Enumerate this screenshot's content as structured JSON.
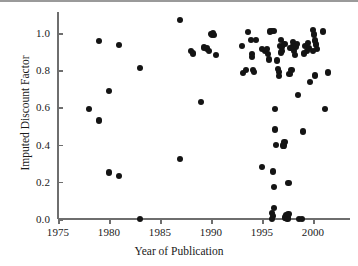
{
  "chart_data": {
    "type": "scatter",
    "title": "",
    "xlabel": "Year of Publication",
    "ylabel": "Imputed Discount Factor",
    "xlim": [
      1975,
      2003.6
    ],
    "ylim": [
      0.0,
      1.12
    ],
    "grid": false,
    "legend": null,
    "xticks": [
      1975,
      1980,
      1985,
      1990,
      1995,
      2000
    ],
    "xtick_labels": [
      "1975",
      "1980",
      "1985",
      "1990",
      "1995",
      "2000"
    ],
    "yticks": [
      0.0,
      0.2,
      0.4,
      0.6,
      0.8,
      1.0
    ],
    "ytick_labels": [
      "0.0",
      "0.2",
      "0.4",
      "0.6",
      "0.8",
      "1.0"
    ],
    "marker": "filled-circle",
    "marker_color": "#141414",
    "marker_size_px": 6.2,
    "n_points": 97,
    "points": [
      [
        1978.0,
        0.59
      ],
      [
        1979.0,
        0.955
      ],
      [
        1979.0,
        0.53
      ],
      [
        1980.0,
        0.69
      ],
      [
        1980.0,
        0.25
      ],
      [
        1981.0,
        0.935
      ],
      [
        1981.0,
        0.23
      ],
      [
        1983.0,
        0.812
      ],
      [
        1983.0,
        0.0
      ],
      [
        1987.0,
        1.07
      ],
      [
        1987.0,
        0.323
      ],
      [
        1988.0,
        0.902
      ],
      [
        1988.2,
        0.89
      ],
      [
        1989.0,
        0.628
      ],
      [
        1989.3,
        0.922
      ],
      [
        1989.6,
        0.917
      ],
      [
        1989.8,
        0.905
      ],
      [
        1990.0,
        0.995
      ],
      [
        1990.2,
        1.0
      ],
      [
        1990.1,
        0.992
      ],
      [
        1990.5,
        0.88
      ],
      [
        1993.0,
        0.93
      ],
      [
        1993.1,
        0.787
      ],
      [
        1993.6,
        1.005
      ],
      [
        1993.9,
        0.962
      ],
      [
        1994.0,
        0.885
      ],
      [
        1994.0,
        0.87
      ],
      [
        1994.1,
        0.8
      ],
      [
        1994.2,
        0.79
      ],
      [
        1995.0,
        0.278
      ],
      [
        1995.3,
        0.905
      ],
      [
        1995.5,
        0.915
      ],
      [
        1995.6,
        0.886
      ],
      [
        1995.7,
        0.858
      ],
      [
        1995.8,
        1.008
      ],
      [
        1996.0,
        1.012
      ],
      [
        1996.2,
        1.01
      ],
      [
        1996.0,
        0.033
      ],
      [
        1996.1,
        0.018
      ],
      [
        1996.0,
        0.0
      ],
      [
        1996.2,
        0.06
      ],
      [
        1996.1,
        0.255
      ],
      [
        1996.2,
        0.17
      ],
      [
        1996.3,
        0.481
      ],
      [
        1996.3,
        0.592
      ],
      [
        1996.4,
        0.397
      ],
      [
        1996.6,
        0.805
      ],
      [
        1996.7,
        0.79
      ],
      [
        1996.7,
        0.768
      ],
      [
        1996.8,
        0.93
      ],
      [
        1996.9,
        0.962
      ],
      [
        1997.0,
        0.925
      ],
      [
        1997.0,
        0.905
      ],
      [
        1997.1,
        0.395
      ],
      [
        1997.2,
        0.412
      ],
      [
        1997.3,
        0.008
      ],
      [
        1997.4,
        0.02
      ],
      [
        1997.5,
        0.0
      ],
      [
        1997.5,
        0.012
      ],
      [
        1997.6,
        0.028
      ],
      [
        1997.6,
        0.192
      ],
      [
        1997.7,
        0.78
      ],
      [
        1997.9,
        0.8
      ],
      [
        1998.0,
        0.95
      ],
      [
        1998.1,
        0.905
      ],
      [
        1998.2,
        0.88
      ],
      [
        1998.3,
        0.925
      ],
      [
        1998.4,
        0.94
      ],
      [
        1998.5,
        0.668
      ],
      [
        1998.6,
        0.0
      ],
      [
        1998.9,
        0.0
      ],
      [
        1999.0,
        0.47
      ],
      [
        1999.2,
        0.932
      ],
      [
        1999.4,
        0.905
      ],
      [
        1999.5,
        0.945
      ],
      [
        1999.6,
        0.918
      ],
      [
        1999.7,
        0.738
      ],
      [
        2000.0,
        1.018
      ],
      [
        2000.1,
        0.992
      ],
      [
        2000.2,
        0.96
      ],
      [
        2000.3,
        0.938
      ],
      [
        2000.4,
        0.915
      ],
      [
        2000.2,
        0.772
      ],
      [
        2001.0,
        1.008
      ],
      [
        2001.2,
        0.592
      ],
      [
        2001.5,
        0.788
      ],
      [
        1994.4,
        0.962
      ],
      [
        1995.0,
        0.915
      ],
      [
        1996.5,
        0.852
      ],
      [
        1997.2,
        0.94
      ],
      [
        1998.0,
        0.93
      ],
      [
        1999.1,
        0.89
      ],
      [
        2000.0,
        0.905
      ],
      [
        1990.3,
        0.99
      ],
      [
        1993.4,
        0.8
      ],
      [
        1996.9,
        0.895
      ],
      [
        1997.8,
        0.92
      ]
    ]
  }
}
